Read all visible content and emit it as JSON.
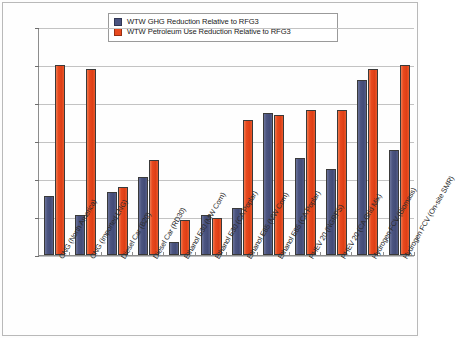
{
  "chart_data": {
    "type": "bar",
    "title": "",
    "xlabel": "",
    "ylabel": "",
    "ylim": [
      0,
      120
    ],
    "ytick_labels": [
      "120%",
      "100%",
      "80%",
      "60%",
      "40%",
      "20%",
      "0%"
    ],
    "ytick_values": [
      120,
      100,
      80,
      60,
      40,
      20,
      0
    ],
    "grid": true,
    "legend_position": "top-center",
    "categories": [
      "CNG (North America)",
      "CNG (Imported LNG)",
      "Diesel Car (B20)",
      "Diesel Car (RD30)",
      "Ethanol E30 (MW Corn)",
      "Ethanol E30 (CA Poplar)",
      "Ethanol E85 (MW Corn)",
      "Ethanol E85 (CA Poplar)",
      "PHEV 20 (NGRPS)",
      "PHEV 20 (CA Grid Mix)",
      "Hydrogen FCV (Biomass)",
      "Hydrogen FCV (On-site SMR)"
    ],
    "series": [
      {
        "name": "WTW GHG Reduction Relative to RFG3",
        "color": "#4b5480",
        "values": [
          31,
          21,
          33,
          41,
          7,
          21,
          24.5,
          74.5,
          51,
          45.5,
          92,
          55.5
        ]
      },
      {
        "name": "WTW Petroleum Use Reduction Relative to RFG3",
        "color": "#e8491e",
        "values": [
          100,
          98,
          36,
          50,
          18.5,
          19.5,
          71,
          73.5,
          76.5,
          76.5,
          98,
          100
        ]
      }
    ]
  },
  "legend": {
    "items": [
      {
        "label": "WTW GHG Reduction Relative to RFG3",
        "color": "#4b5480"
      },
      {
        "label": "WTW Petroleum Use Reduction Relative to RFG3",
        "color": "#e8491e"
      }
    ]
  }
}
